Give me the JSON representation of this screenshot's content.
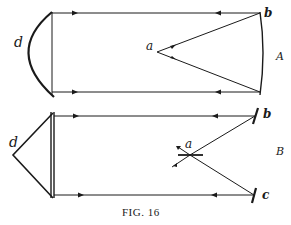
{
  "figure": {
    "caption": "Fig. 16",
    "caption_display": "FIG. 16"
  },
  "diagram_a": {
    "panel_label": "A",
    "labels": {
      "d": "d",
      "a": "a",
      "b": "b"
    },
    "description": "Curved (parabolic) mirror d reflecting parallel rays to a curved mirror at b, converging at focus a"
  },
  "diagram_b": {
    "panel_label": "B",
    "labels": {
      "d": "d",
      "a": "a",
      "b": "b",
      "c": "c"
    },
    "description": "Triangular prism d with parallel rays to plane mirrors b and c, crossing at beam-splitter a"
  },
  "colors": {
    "ink": "#1a1a1a",
    "paper": "#ffffff"
  }
}
